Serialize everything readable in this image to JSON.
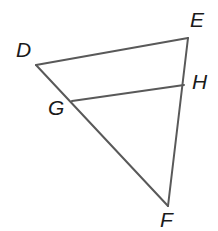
{
  "figure": {
    "kind": "geometry-diagram",
    "shape": "triangle-with-midsegment",
    "width": 218,
    "height": 231,
    "background_color": "#ffffff",
    "stroke_color": "#595959",
    "stroke_width": 2,
    "label_color": "#1a1a1a",
    "vertices": [
      {
        "id": "D",
        "label": "D",
        "x": 36,
        "y": 65
      },
      {
        "id": "E",
        "label": "E",
        "x": 188,
        "y": 38
      },
      {
        "id": "F",
        "label": "F",
        "x": 168,
        "y": 206
      },
      {
        "id": "G",
        "label": "G",
        "x": 72,
        "y": 101
      },
      {
        "id": "H",
        "label": "H",
        "x": 184,
        "y": 85
      }
    ],
    "segments": [
      {
        "id": "DE",
        "from": "D",
        "to": "E"
      },
      {
        "id": "EF",
        "from": "E",
        "to": "F"
      },
      {
        "id": "FD",
        "from": "F",
        "to": "D"
      },
      {
        "id": "GH",
        "from": "G",
        "to": "H"
      }
    ],
    "labels": {
      "D": "D",
      "E": "E",
      "F": "F",
      "G": "G",
      "H": "H"
    }
  }
}
